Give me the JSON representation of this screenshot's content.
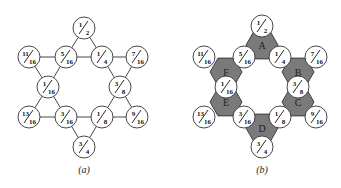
{
  "figure": {
    "panels": [
      {
        "id": "a",
        "caption": "(a)",
        "nodes": [
          {
            "label": "1/2",
            "num": "1",
            "den": "2"
          },
          {
            "label": "11/16",
            "num": "11",
            "den": "16"
          },
          {
            "label": "5/16",
            "num": "5",
            "den": "16"
          },
          {
            "label": "1/4",
            "num": "1",
            "den": "4"
          },
          {
            "label": "7/16",
            "num": "7",
            "den": "16"
          },
          {
            "label": "1/16",
            "num": "1",
            "den": "16"
          },
          {
            "label": "3/8",
            "num": "3",
            "den": "8"
          },
          {
            "label": "13/16",
            "num": "13",
            "den": "16"
          },
          {
            "label": "3/16",
            "num": "3",
            "den": "16"
          },
          {
            "label": "1/8",
            "num": "1",
            "den": "8"
          },
          {
            "label": "9/16",
            "num": "9",
            "den": "16"
          },
          {
            "label": "3/4",
            "num": "3",
            "den": "4"
          }
        ]
      },
      {
        "id": "b",
        "caption": "(b)",
        "hexagons": [
          "A",
          "B",
          "C",
          "D",
          "E",
          "F"
        ],
        "nodes": [
          {
            "label": "1/2",
            "num": "1",
            "den": "2"
          },
          {
            "label": "11/16",
            "num": "11",
            "den": "16"
          },
          {
            "label": "5/16",
            "num": "5",
            "den": "16"
          },
          {
            "label": "1/4",
            "num": "1",
            "den": "4"
          },
          {
            "label": "7/16",
            "num": "7",
            "den": "16"
          },
          {
            "label": "1/16",
            "num": "1",
            "den": "16"
          },
          {
            "label": "3/8",
            "num": "3",
            "den": "8"
          },
          {
            "label": "13/16",
            "num": "13",
            "den": "16"
          },
          {
            "label": "3/16",
            "num": "3",
            "den": "16"
          },
          {
            "label": "1/8",
            "num": "1",
            "den": "8"
          },
          {
            "label": "9/16",
            "num": "9",
            "den": "16"
          },
          {
            "label": "3/4",
            "num": "3",
            "den": "4"
          }
        ]
      }
    ]
  }
}
